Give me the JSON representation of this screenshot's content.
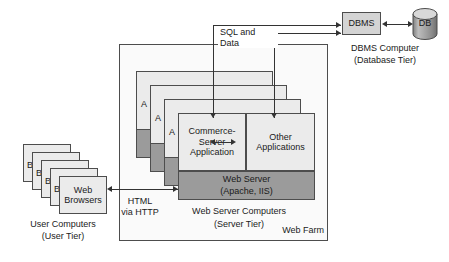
{
  "diagram": {
    "colors": {
      "box_fill_light": "#ebebeb",
      "box_fill_dark": "#9b9b9b",
      "box_fill_white": "#f7f7f7",
      "border": "#4d4d4d",
      "line": "#333333",
      "text": "#1a1a1a",
      "background": "#ffffff"
    }
  },
  "user_tier": {
    "stack_label_front": "Web\nBrowsers",
    "stack_label_back": "B",
    "stack_count": 5,
    "caption_line1": "User Computers",
    "caption_line2": "(User Tier)"
  },
  "connections": {
    "html_http_line1": "HTML",
    "html_http_line2": "via HTTP",
    "sql_and_data": "SQL and Data"
  },
  "server_tier": {
    "farm_label": "Web Farm",
    "stack_count": 4,
    "stack_label_back": "A",
    "commerce_app": "Commerce-\nServer\nApplication",
    "other_apps": "Other\nApplications",
    "web_server_line1": "Web Server",
    "web_server_line2": "(Apache, IIS)",
    "caption_line1": "Web Server Computers",
    "caption_line2": "(Server Tier)"
  },
  "database_tier": {
    "dbms_label": "DBMS",
    "db_label": "DB",
    "caption_line1": "DBMS Computer",
    "caption_line2": "(Database Tier)"
  }
}
